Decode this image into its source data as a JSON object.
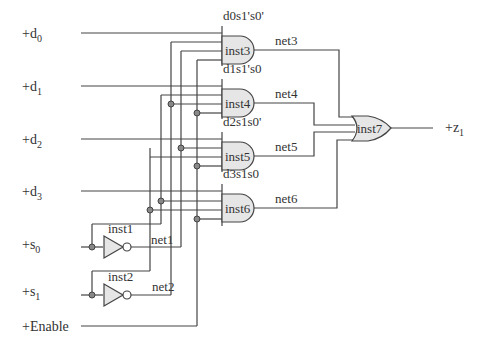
{
  "diagram": {
    "inputs": [
      {
        "id": "d0",
        "label": "+d",
        "sub": "0"
      },
      {
        "id": "d1",
        "label": "+d",
        "sub": "1"
      },
      {
        "id": "d2",
        "label": "+d",
        "sub": "2"
      },
      {
        "id": "d3",
        "label": "+d",
        "sub": "3"
      },
      {
        "id": "s0",
        "label": "+s",
        "sub": "0"
      },
      {
        "id": "s1",
        "label": "+s",
        "sub": "1"
      },
      {
        "id": "enable",
        "label": "+Enable",
        "sub": ""
      }
    ],
    "output": {
      "id": "z1",
      "label": "+z",
      "sub": "1"
    },
    "and_gates": [
      {
        "name": "inst3",
        "net": "net3",
        "term": "d0s1's0'"
      },
      {
        "name": "inst4",
        "net": "net4",
        "term": "d1s1's0"
      },
      {
        "name": "inst5",
        "net": "net5",
        "term": "d2s1s0'"
      },
      {
        "name": "inst6",
        "net": "net6",
        "term": "d3s1s0"
      }
    ],
    "inverters": [
      {
        "name": "inst1",
        "net": "net1"
      },
      {
        "name": "inst2",
        "net": "net2"
      }
    ],
    "or_gate": {
      "name": "inst7"
    },
    "colors": {
      "wire": "#444444",
      "gate_fill": "#e6e6e6",
      "junction": "#888888"
    }
  }
}
